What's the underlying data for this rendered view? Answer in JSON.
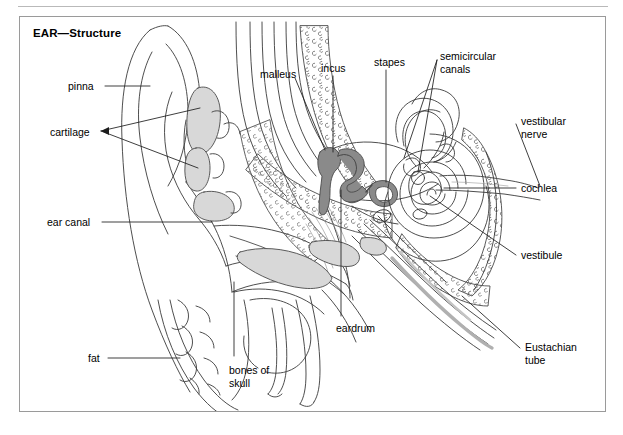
{
  "figure": {
    "title": "EAR—Structure",
    "frame_border_color": "#9a9a9a",
    "top_rule_color": "#b9b9b9",
    "background_color": "#ffffff",
    "line_color": "#3a3a3a",
    "ossicle_fill": "#8a8a8a",
    "cartilage_fill": "#d8d8d8",
    "soft_tissue_fill": "#e8e8e8"
  },
  "labels": {
    "pinna": "pinna",
    "cartilage": "cartilage",
    "ear_canal": "ear canal",
    "fat": "fat",
    "bones_of_skull": "bones of\nskull",
    "malleus": "malleus",
    "incus": "incus",
    "stapes": "stapes",
    "semicircular_canals": "semicircular\ncanals",
    "vestibular_nerve": "vestibular\nnerve",
    "cochlea": "cochlea",
    "vestibule": "vestibule",
    "eardrum": "eardrum",
    "eustachian_tube": "Eustachian\ntube"
  },
  "label_positions": {
    "pinna": {
      "x": 68,
      "y": 80
    },
    "cartilage": {
      "x": 50,
      "y": 126
    },
    "ear_canal": {
      "x": 47,
      "y": 216
    },
    "fat": {
      "x": 88,
      "y": 352
    },
    "bones_of_skull": {
      "x": 229,
      "y": 364
    },
    "malleus": {
      "x": 260,
      "y": 68
    },
    "incus": {
      "x": 321,
      "y": 62
    },
    "stapes": {
      "x": 374,
      "y": 56
    },
    "semicircular_canals": {
      "x": 440,
      "y": 50
    },
    "vestibular_nerve": {
      "x": 521,
      "y": 115
    },
    "cochlea": {
      "x": 521,
      "y": 182
    },
    "vestibule": {
      "x": 521,
      "y": 249
    },
    "eardrum": {
      "x": 336,
      "y": 322
    },
    "eustachian_tube": {
      "x": 525,
      "y": 341
    }
  }
}
